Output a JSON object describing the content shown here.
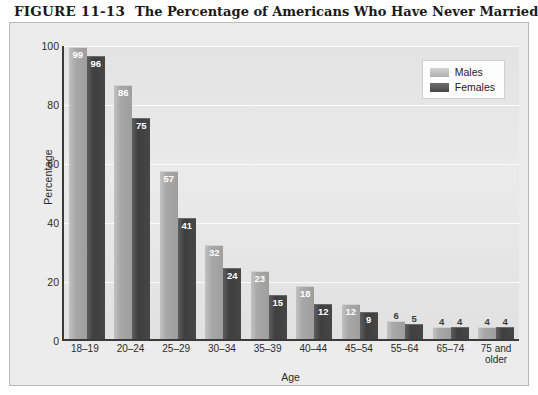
{
  "figure": {
    "number": "FIGURE 11-13",
    "caption": "The Percentage of Americans Who Have Never Married"
  },
  "legend": {
    "males_label": "Males",
    "females_label": "Females"
  },
  "colors": {
    "males_bar": "#a8a8a8",
    "females_bar": "#434343",
    "plot_background": "#e6e6e6",
    "panel_background": "#ececec",
    "axis": "#3a3a3a",
    "gridline": "#fbfbfb"
  },
  "chart_data": {
    "type": "bar",
    "title": "The Percentage of Americans Who Have Never Married",
    "xlabel": "Age",
    "ylabel": "Percentage",
    "ylim": [
      0,
      100
    ],
    "yticks": [
      100,
      80,
      60,
      40,
      20,
      0
    ],
    "grid": true,
    "legend_position": "top-right",
    "categories": [
      "18–19",
      "20–24",
      "25–29",
      "30–34",
      "35–39",
      "40–44",
      "45–54",
      "55–64",
      "65–74",
      "75 and\nolder"
    ],
    "series": [
      {
        "name": "Males",
        "values": [
          99,
          86,
          57,
          32,
          23,
          18,
          12,
          6,
          4,
          4
        ]
      },
      {
        "name": "Females",
        "values": [
          96,
          75,
          41,
          24,
          15,
          12,
          9,
          5,
          4,
          4
        ]
      }
    ]
  }
}
